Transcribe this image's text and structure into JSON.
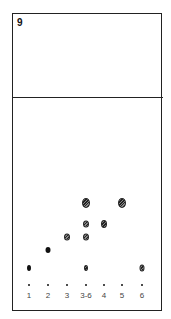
{
  "figure": {
    "panel_label": "9",
    "type": "thin-layer chromatogram"
  },
  "lanes": [
    {
      "label": "1",
      "x": 29
    },
    {
      "label": "2",
      "x": 48
    },
    {
      "label": "3",
      "x": 67
    },
    {
      "label": "3-6",
      "x": 86
    },
    {
      "label": "4",
      "x": 104
    },
    {
      "label": "5",
      "x": 122
    },
    {
      "label": "6",
      "x": 142
    }
  ],
  "spots": [
    {
      "lane": "1",
      "x": 29,
      "y": 268,
      "w": 4,
      "h": 6,
      "style": "dark"
    },
    {
      "lane": "2",
      "x": 48,
      "y": 250,
      "w": 5,
      "h": 6,
      "style": "dark"
    },
    {
      "lane": "3",
      "x": 67,
      "y": 237,
      "w": 6,
      "h": 7,
      "style": "hatched"
    },
    {
      "lane": "3-6",
      "x": 86,
      "y": 203,
      "w": 8,
      "h": 10,
      "style": "hatched"
    },
    {
      "lane": "3-6",
      "x": 86,
      "y": 224,
      "w": 6,
      "h": 7,
      "style": "hatched"
    },
    {
      "lane": "3-6",
      "x": 86,
      "y": 237,
      "w": 6,
      "h": 7,
      "style": "hatched"
    },
    {
      "lane": "3-6",
      "x": 86,
      "y": 268,
      "w": 4,
      "h": 6,
      "style": "hatched"
    },
    {
      "lane": "4",
      "x": 104,
      "y": 224,
      "w": 6,
      "h": 8,
      "style": "hatched"
    },
    {
      "lane": "5",
      "x": 122,
      "y": 203,
      "w": 8,
      "h": 10,
      "style": "hatched"
    },
    {
      "lane": "6",
      "x": 142,
      "y": 268,
      "w": 5,
      "h": 7,
      "style": "hatched"
    }
  ],
  "origin_y": 285,
  "label_y": 291
}
